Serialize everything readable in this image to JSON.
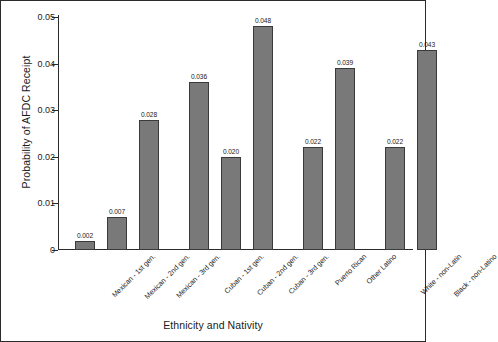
{
  "chart_data": {
    "type": "bar",
    "title": "",
    "xlabel": "Ethnicity and Nativity",
    "ylabel": "Probability of AFDC Receipt",
    "ylim": [
      0,
      0.05
    ],
    "yticks": [
      "0",
      "0.01",
      "0.02",
      "0.03",
      "0.04",
      "0.05"
    ],
    "ytick_values": [
      0,
      0.01,
      0.02,
      0.03,
      0.04,
      0.05
    ],
    "grid": false,
    "legend": "none",
    "bar_color": "#797979",
    "bar_edge_color": "#3a3a3a",
    "axis_color": "#2b2b2b",
    "categories": [
      "Mexican - 1st gen.",
      "Mexican - 2nd gen.",
      "Mexican - 3rd gen.",
      "Cuban - 1st gen.",
      "Cuban - 2nd gen.",
      "Cuban - 3rd gen.",
      "Puerto Rican",
      "Other Latino",
      "White - non-Latin",
      "Black - non-Latino"
    ],
    "values": [
      0.002,
      0.007,
      0.028,
      0.036,
      0.02,
      0.048,
      0.022,
      0.039,
      0.022,
      0.043
    ],
    "value_labels": [
      "0.002",
      "0.007",
      "0.028",
      "0.036",
      "0.020",
      "0.048",
      "0.022",
      "0.039",
      "0.022",
      "0.043"
    ],
    "groups": [
      {
        "name": "Mexican",
        "indices": [
          0,
          1,
          2
        ]
      },
      {
        "name": "Cuban",
        "indices": [
          3,
          4,
          5
        ]
      },
      {
        "name": "Latino other",
        "indices": [
          6,
          7
        ]
      },
      {
        "name": "Non-Latino",
        "indices": [
          8,
          9
        ]
      }
    ]
  }
}
